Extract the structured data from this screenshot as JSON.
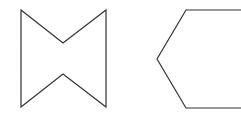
{
  "diagram": {
    "background": "#ffffff",
    "stroke_color": "#333333",
    "stroke_width": 1.2,
    "shapes": [
      {
        "name": "bowtie-polygon",
        "type": "concave-hexagon",
        "points": "21,10 63,43 106,10 106,107 63,74 21,107"
      },
      {
        "name": "hexagon-polygon",
        "type": "hexagon-partial",
        "points": "186,10 245,10 245,108 186,108 157,59"
      }
    ]
  }
}
